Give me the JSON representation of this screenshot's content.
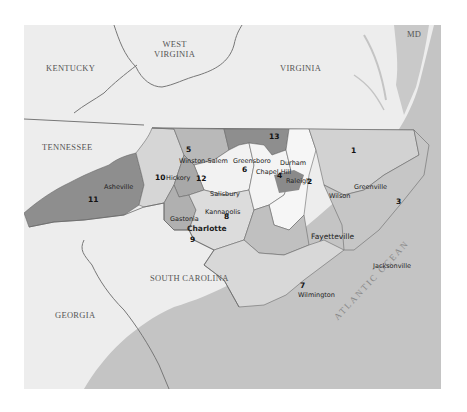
{
  "map": {
    "title": "North Carolina Congressional Districts",
    "colors": {
      "background": "#ffffff",
      "land_neighbors": "#ededed",
      "ocean": "#c4c4c4",
      "district_dark": "#8e8e8e",
      "district_mid": "#b0b0b0",
      "district_light": "#d6d6d6",
      "district_lighter": "#e6e6e6",
      "district_white": "#f6f6f6",
      "border": "#6a6a6a"
    },
    "neighbor_states": [
      {
        "name": "KENTUCKY"
      },
      {
        "name": "WEST\nVIRGINIA",
        "line1": "WEST",
        "line2": "VIRGINIA"
      },
      {
        "name": "VIRGINIA"
      },
      {
        "name": "MD"
      },
      {
        "name": "TENNESSEE"
      },
      {
        "name": "SOUTH CAROLINA"
      },
      {
        "name": "GEORGIA"
      }
    ],
    "ocean_label": "ATLANTIC OCEAN",
    "districts": [
      {
        "number": "1"
      },
      {
        "number": "2"
      },
      {
        "number": "3"
      },
      {
        "number": "4"
      },
      {
        "number": "5"
      },
      {
        "number": "6"
      },
      {
        "number": "7"
      },
      {
        "number": "8"
      },
      {
        "number": "9"
      },
      {
        "number": "10"
      },
      {
        "number": "11"
      },
      {
        "number": "12"
      },
      {
        "number": "13"
      }
    ],
    "cities": [
      {
        "name": "Winston-Salem"
      },
      {
        "name": "Greensboro"
      },
      {
        "name": "Durham"
      },
      {
        "name": "Chapel Hill"
      },
      {
        "name": "Raleigh"
      },
      {
        "name": "Charlotte"
      },
      {
        "name": "Fayetteville"
      },
      {
        "name": "Wilmington"
      },
      {
        "name": "Jacksonville"
      },
      {
        "name": "Asheville"
      },
      {
        "name": "Hickory"
      },
      {
        "name": "Gastonia"
      },
      {
        "name": "Kannapolis"
      },
      {
        "name": "Salisbury"
      },
      {
        "name": "Wilson"
      },
      {
        "name": "Greenville"
      }
    ]
  }
}
